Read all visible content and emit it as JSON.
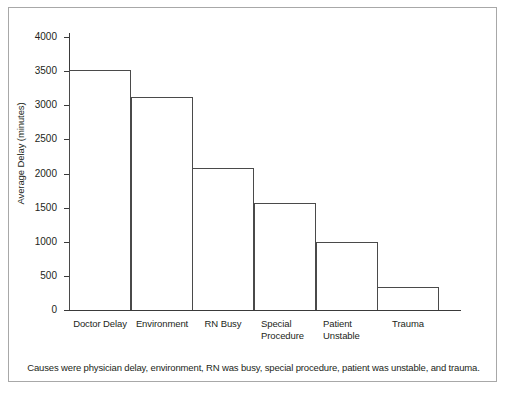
{
  "chart_data": {
    "type": "bar",
    "title": "",
    "xlabel": "",
    "ylabel": "Average Delay (minutes)",
    "categories": [
      "Doctor Delay",
      "Environment",
      "RN Busy",
      "Special Procedure",
      "Patient Unstable",
      "Trauma"
    ],
    "values": [
      3510,
      3120,
      2080,
      1570,
      1000,
      330
    ],
    "ylim": [
      0,
      4000
    ],
    "yticks": [
      0,
      500,
      1000,
      1500,
      2000,
      2500,
      3000,
      3500,
      4000
    ],
    "ytick_labels": [
      "0",
      "500",
      "1000",
      "1500",
      "2000",
      "2500",
      "3000",
      "3500",
      "4000"
    ],
    "grid": false,
    "legend": null,
    "bar_style": "white fill, thin dark outline, contiguous bars"
  },
  "category_label_lines": [
    [
      "Doctor Delay"
    ],
    [
      "Environment"
    ],
    [
      "RN Busy"
    ],
    [
      "Special",
      "Procedure"
    ],
    [
      "Patient",
      "Unstable"
    ],
    [
      "Trauma"
    ]
  ],
  "caption": "Causes were physician delay, environment, RN was busy, special procedure, patient was unstable, and trauma.",
  "colors": {
    "background": "#ffffff",
    "frame_border": "#a8a8a8",
    "axis": "#3a3a3a",
    "bar_outline": "#4a4a4a",
    "bar_fill": "#ffffff",
    "text": "#231f20"
  }
}
